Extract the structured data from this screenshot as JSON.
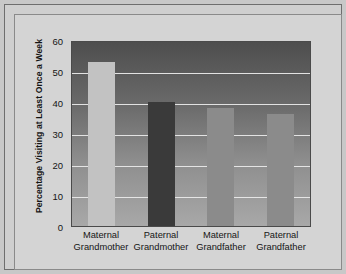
{
  "chart_data": {
    "type": "bar",
    "title": "",
    "xlabel": "",
    "ylabel": "Percentage Visiting at Least Once a Week",
    "ylim": [
      0,
      60
    ],
    "ytick_values": [
      60,
      50,
      40,
      30,
      20,
      10,
      0
    ],
    "ytick_labels": [
      "60",
      "50",
      "40",
      "30",
      "20",
      "10",
      "0"
    ],
    "grid": true,
    "legend": "none",
    "categories": [
      "Maternal Grandmother",
      "Paternal Grandmother",
      "Maternal Grandfather",
      "Paternal Grandfather"
    ],
    "category_lines": [
      {
        "line1": "Maternal",
        "line2": "Grandmother"
      },
      {
        "line1": "Paternal",
        "line2": "Grandmother"
      },
      {
        "line1": "Maternal",
        "line2": "Grandfather"
      },
      {
        "line1": "Paternal",
        "line2": "Grandfather"
      }
    ],
    "values": [
      53,
      40,
      38,
      36
    ],
    "bar_colors": [
      "#c2c2c2",
      "#3a3a3a",
      "#8b8b8b",
      "#8b8b8b"
    ]
  },
  "figure": {
    "background_color": "#cfcfcf",
    "plot_top_color": "#4e4e4e",
    "plot_bottom_color": "#a8a8a8",
    "gridline_color": "#e9e9e9",
    "axis_color": "#4a4a4a",
    "text_color": "#141414"
  }
}
